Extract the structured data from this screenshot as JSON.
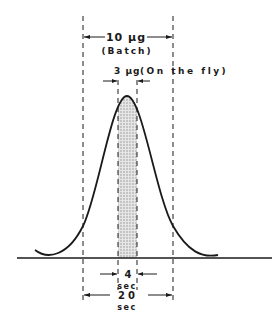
{
  "diagram": {
    "type": "chromatographic-peak-sampling",
    "labels": {
      "batch_amount": "10 µg",
      "batch_mode": "(Batch)",
      "fly_amount": "3 µg",
      "fly_mode": "(On the fly)",
      "narrow_time_value": "4",
      "narrow_time_unit": "sec",
      "wide_time_value": "20",
      "wide_time_unit": "sec"
    },
    "colors": {
      "line": "#1a1a1a",
      "shade": "#cfcfcf"
    }
  }
}
